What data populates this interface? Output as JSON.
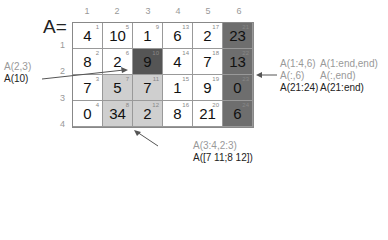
{
  "title": "A=",
  "column_indices": [
    "1",
    "2",
    "3",
    "4",
    "5",
    "6"
  ],
  "row_indices": [
    "1",
    "2",
    "3",
    "4"
  ],
  "matrix": {
    "rows": [
      [
        {
          "v": "4",
          "i": "1",
          "shade": "none"
        },
        {
          "v": "10",
          "i": "5",
          "shade": "none"
        },
        {
          "v": "1",
          "i": "9",
          "shade": "none"
        },
        {
          "v": "6",
          "i": "13",
          "shade": "none"
        },
        {
          "v": "2",
          "i": "17",
          "shade": "none"
        },
        {
          "v": "23",
          "i": "21",
          "shade": "dark"
        }
      ],
      [
        {
          "v": "8",
          "i": "2",
          "shade": "none"
        },
        {
          "v": "2",
          "i": "6",
          "shade": "none"
        },
        {
          "v": "9",
          "i": "10",
          "shade": "darkest"
        },
        {
          "v": "4",
          "i": "14",
          "shade": "none"
        },
        {
          "v": "7",
          "i": "18",
          "shade": "none"
        },
        {
          "v": "13",
          "i": "22",
          "shade": "dark"
        }
      ],
      [
        {
          "v": "7",
          "i": "3",
          "shade": "none"
        },
        {
          "v": "5",
          "i": "7",
          "shade": "light"
        },
        {
          "v": "7",
          "i": "11",
          "shade": "light"
        },
        {
          "v": "1",
          "i": "15",
          "shade": "none"
        },
        {
          "v": "9",
          "i": "19",
          "shade": "none"
        },
        {
          "v": "0",
          "i": "23",
          "shade": "dark"
        }
      ],
      [
        {
          "v": "0",
          "i": "4",
          "shade": "none"
        },
        {
          "v": "34",
          "i": "8",
          "shade": "light"
        },
        {
          "v": "2",
          "i": "12",
          "shade": "light"
        },
        {
          "v": "8",
          "i": "16",
          "shade": "none"
        },
        {
          "v": "21",
          "i": "20",
          "shade": "none"
        },
        {
          "v": "6",
          "i": "24",
          "shade": "dark"
        }
      ]
    ]
  },
  "annotations": {
    "single": {
      "subscript": "A(2,3)",
      "linear": "A(10)"
    },
    "block": {
      "subscript": "A(3:4,2:3)",
      "linear": "A([7 11;8 12])"
    },
    "column": {
      "line1a": "A(1:4,6)",
      "line1b": "A(1:end,end)",
      "line2a": "A(:,6)",
      "line2b": "A(:,end)",
      "line3a": "A(21:24)",
      "line3b": "A(21:end)"
    }
  },
  "colors": {
    "light": "#cfcfcf",
    "dark": "#6e6e6e",
    "darkest": "#555555",
    "annotation_grey": "#999999"
  }
}
